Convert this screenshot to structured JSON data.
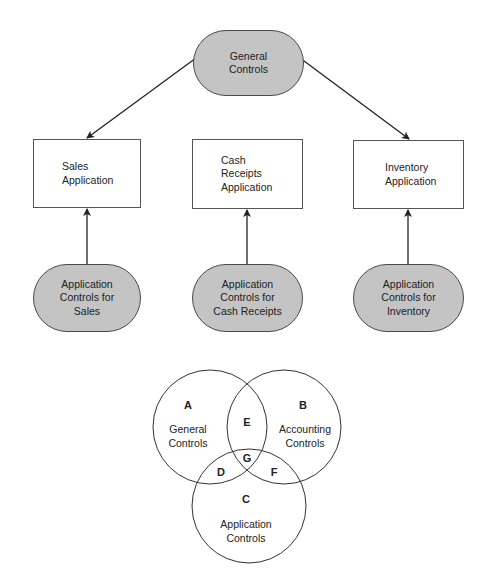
{
  "flow": {
    "top": {
      "label": "General\nControls"
    },
    "applications": [
      {
        "label": "Sales\nApplication"
      },
      {
        "label": "Cash\nReceipts\nApplication"
      },
      {
        "label": "Inventory\nApplication"
      }
    ],
    "app_controls": [
      {
        "label": "Application\nControls for\nSales"
      },
      {
        "label": "Application\nControls for\nCash Receipts"
      },
      {
        "label": "Application\nControls for\nInventory"
      }
    ]
  },
  "venn": {
    "circles": [
      {
        "letter": "A",
        "label": "General\nControls"
      },
      {
        "letter": "B",
        "label": "Accounting\nControls"
      },
      {
        "letter": "C",
        "label": "Application\nControls"
      }
    ],
    "intersections": [
      {
        "letter": "E",
        "between": "A-B"
      },
      {
        "letter": "D",
        "between": "A-C"
      },
      {
        "letter": "F",
        "between": "B-C"
      },
      {
        "letter": "G",
        "between": "A-B-C"
      }
    ]
  },
  "colors": {
    "oval_fill": "#c4c4c4",
    "stroke": "#333333",
    "background": "#ffffff"
  }
}
